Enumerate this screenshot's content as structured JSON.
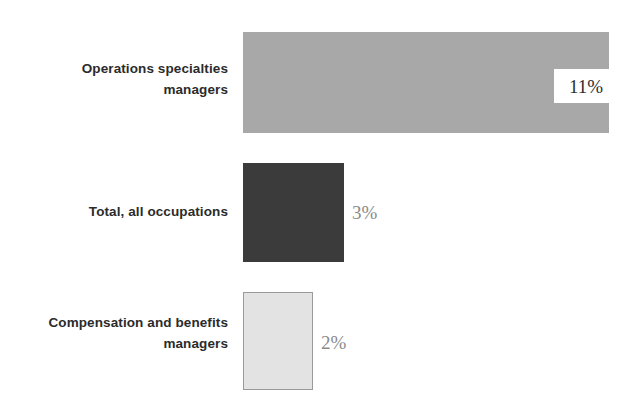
{
  "chart_data": {
    "type": "bar",
    "orientation": "horizontal",
    "title": "",
    "subtitle": "",
    "xlabel": "",
    "ylabel": "",
    "grid": false,
    "legend": false,
    "axis_visible": false,
    "xlim": [
      0,
      11
    ],
    "categories": [
      "Operations specialties\nmanagers",
      "Total, all occupations",
      "Compensation and benefits\nmanagers"
    ],
    "values": [
      11,
      3,
      2
    ],
    "value_labels": [
      "11%",
      "3%",
      "2%"
    ],
    "bar_colors": [
      "#a8a8a8",
      "#3b3b3b",
      "#e3e3e3"
    ],
    "bar_border_colors": [
      "none",
      "none",
      "#9a9a9a"
    ],
    "label_positions": [
      "inside-end-white-box",
      "outside-end",
      "outside-end"
    ]
  },
  "colors": {
    "background": "#ffffff",
    "category_text": "#2b2b2b",
    "value_text": "#8b8b8b",
    "value_text_dark": "#2e2e2e",
    "bar_1": "#a8a8a8",
    "bar_2": "#3b3b3b",
    "bar_3": "#e3e3e3",
    "bar_3_border": "#9a9a9a"
  }
}
